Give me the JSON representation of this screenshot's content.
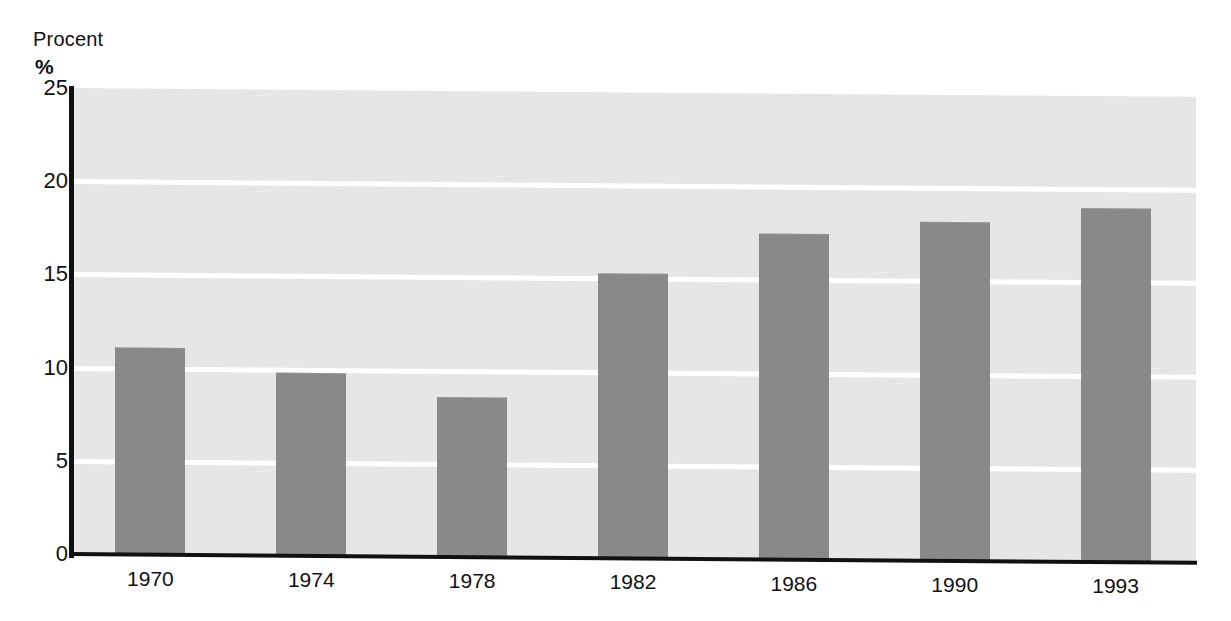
{
  "chart_data": {
    "type": "bar",
    "title": "",
    "subtitle": "",
    "ylabel_line1": "Procent",
    "ylabel_line2": "%",
    "xlabel": "",
    "categories": [
      "1970",
      "1974",
      "1978",
      "1982",
      "1986",
      "1990",
      "1993"
    ],
    "values": [
      11.1,
      9.8,
      8.6,
      15.3,
      17.5,
      18.2,
      19.0
    ],
    "ylim": [
      0,
      25
    ],
    "yticks": [
      0,
      5,
      10,
      15,
      20,
      25
    ],
    "ytick_labels": [
      "0",
      "5",
      "10",
      "15",
      "20",
      "25"
    ],
    "grid": true,
    "grid_orientation": "horizontal",
    "legend": false,
    "legend_position": "none",
    "bar_color": "#898989",
    "plot_background": "#e6e6e6",
    "gridline_color": "#ffffff",
    "axis_color": "#111111",
    "page_background": "#ffffff"
  },
  "axis": {
    "y_caption_top": "Procent",
    "y_caption_unit": "%"
  }
}
